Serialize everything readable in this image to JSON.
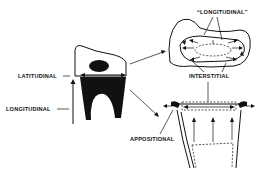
{
  "diagram": {
    "labels": {
      "latitudinal": "LATITUDINAL",
      "longitudinal_left": "LONGITUDINAL",
      "longitudinal_top": "“LONGITUDINAL”",
      "interstitial": "INTERSTITIAL",
      "appositional": "APPOSITIONAL"
    },
    "panels": [
      {
        "name": "tooth-side-view",
        "description": "Whole tooth with dark enamel organ and crown outline"
      },
      {
        "name": "top-view",
        "description": "Occlusal view showing longitudinal and interstitial growth arrows"
      },
      {
        "name": "root-view",
        "description": "Root cross-section showing appositional growth with upward arrows"
      }
    ],
    "colors": {
      "ink": "#111111",
      "background": "#ffffff"
    }
  }
}
